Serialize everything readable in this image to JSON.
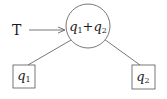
{
  "diagram": {
    "input_label": "T",
    "root": {
      "var1": "q",
      "sub1": "1",
      "op": "+",
      "var2": "q",
      "sub2": "2"
    },
    "left_leaf": {
      "var": "q",
      "sub": "1"
    },
    "right_leaf": {
      "var": "q",
      "sub": "2"
    }
  },
  "colors": {
    "stroke": "#555555",
    "text": "#1a1a1a",
    "label_T": "#1a1a1a"
  }
}
